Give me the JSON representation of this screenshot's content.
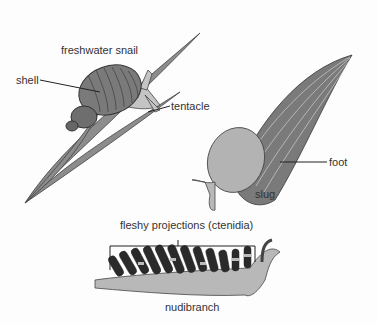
{
  "figure": {
    "organisms": [
      {
        "name": "freshwater snail",
        "parts": [
          "shell",
          "tentacle"
        ]
      },
      {
        "name": "slug",
        "parts": [
          "foot"
        ]
      },
      {
        "name": "nudibranch",
        "parts": [
          "fleshy projections (ctenidia)"
        ]
      }
    ],
    "labels": {
      "snail_title": "freshwater snail",
      "shell": "shell",
      "tentacle": "tentacle",
      "slug_title": "slug",
      "foot": "foot",
      "ctenidia": "fleshy projections (ctenidia)",
      "nudibranch_title": "nudibranch"
    },
    "colors": {
      "body": "#b8b8b8",
      "shell": "#7a7a7a",
      "leaf": "#8c8c8c",
      "outline": "#333333",
      "dark_projection": "#2a2a2a"
    }
  }
}
